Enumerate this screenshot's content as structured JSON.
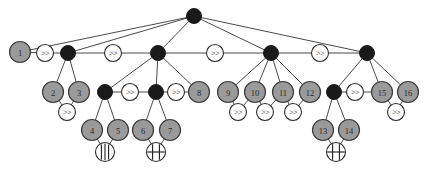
{
  "figure": {
    "background_color": "#ffffff",
    "width": 425,
    "height": 170
  },
  "legend": {
    "gray_node": "numbered leaf / task node",
    "black_node": "unlabeled junction node",
    "open_node": "operator marker node"
  },
  "glyphs": {
    "sequence": ">>",
    "parallel_bars": "|||",
    "sync_bar": "H"
  },
  "colors": {
    "gray_fill": "#9a9a9a",
    "black_fill": "#1a1a1a",
    "open_fill": "#ffffff",
    "edge": "#4a4a4a",
    "outline": "#3a3a3a"
  },
  "nodes": [
    {
      "id": "root",
      "kind": "black",
      "label": "",
      "x": 194,
      "y": 16,
      "r": 7.5
    },
    {
      "id": "n1",
      "kind": "gray",
      "label": "1",
      "x": 20,
      "y": 52,
      "r": 10.5
    },
    {
      "id": "op_a",
      "kind": "open",
      "glyph": ">>",
      "x": 45,
      "y": 53,
      "r": 8.5
    },
    {
      "id": "b1",
      "kind": "black",
      "label": "",
      "x": 68,
      "y": 53,
      "r": 7.5
    },
    {
      "id": "op_b",
      "kind": "open",
      "glyph": ">>",
      "x": 113,
      "y": 53,
      "r": 8.5
    },
    {
      "id": "b2",
      "kind": "black",
      "label": "",
      "x": 158,
      "y": 53,
      "r": 7.5
    },
    {
      "id": "op_c",
      "kind": "open",
      "glyph": ">>",
      "x": 215,
      "y": 53,
      "r": 8.5
    },
    {
      "id": "b3",
      "kind": "black",
      "label": "",
      "x": 271,
      "y": 53,
      "r": 7.5
    },
    {
      "id": "op_d",
      "kind": "open",
      "glyph": ">>",
      "x": 320,
      "y": 53,
      "r": 8.5
    },
    {
      "id": "b4",
      "kind": "black",
      "label": "",
      "x": 367,
      "y": 53,
      "r": 7.5
    },
    {
      "id": "n2",
      "kind": "gray",
      "label": "2",
      "x": 53,
      "y": 92,
      "r": 10.5
    },
    {
      "id": "n3",
      "kind": "gray",
      "label": "3",
      "x": 79,
      "y": 92,
      "r": 10.5
    },
    {
      "id": "op_e",
      "kind": "open",
      "glyph": ">>",
      "x": 67,
      "y": 112,
      "r": 8.5
    },
    {
      "id": "b5",
      "kind": "black",
      "label": "",
      "x": 105,
      "y": 92,
      "r": 7.5
    },
    {
      "id": "op_f",
      "kind": "open",
      "glyph": ">>",
      "x": 130,
      "y": 92,
      "r": 8.5
    },
    {
      "id": "b6",
      "kind": "black",
      "label": "",
      "x": 156,
      "y": 92,
      "r": 7.5
    },
    {
      "id": "op_g",
      "kind": "open",
      "glyph": ">>",
      "x": 176,
      "y": 92,
      "r": 8.5
    },
    {
      "id": "n8",
      "kind": "gray",
      "label": "8",
      "x": 199,
      "y": 92,
      "r": 10.5
    },
    {
      "id": "n4",
      "kind": "gray",
      "label": "4",
      "x": 92,
      "y": 130,
      "r": 10.5
    },
    {
      "id": "n5",
      "kind": "gray",
      "label": "5",
      "x": 118,
      "y": 130,
      "r": 10.5
    },
    {
      "id": "g_bars",
      "kind": "glyph",
      "glyph": "|||",
      "x": 105,
      "y": 152,
      "r": 9.5
    },
    {
      "id": "n6",
      "kind": "gray",
      "label": "6",
      "x": 143,
      "y": 130,
      "r": 10.5
    },
    {
      "id": "n7",
      "kind": "gray",
      "label": "7",
      "x": 170,
      "y": 130,
      "r": 10.5
    },
    {
      "id": "g_synca",
      "kind": "glyph",
      "glyph": "H",
      "x": 156,
      "y": 152,
      "r": 9.5
    },
    {
      "id": "n9",
      "kind": "gray",
      "label": "9",
      "x": 228,
      "y": 92,
      "r": 10.5
    },
    {
      "id": "op_h",
      "kind": "open",
      "glyph": ">>",
      "x": 238,
      "y": 112,
      "r": 8.5
    },
    {
      "id": "n10",
      "kind": "gray",
      "label": "10",
      "x": 255,
      "y": 92,
      "r": 10.5
    },
    {
      "id": "op_i",
      "kind": "open",
      "glyph": ">>",
      "x": 265,
      "y": 112,
      "r": 8.5
    },
    {
      "id": "n11",
      "kind": "gray",
      "label": "11",
      "x": 283,
      "y": 92,
      "r": 10.5
    },
    {
      "id": "op_j",
      "kind": "open",
      "glyph": ">>",
      "x": 293,
      "y": 112,
      "r": 8.5
    },
    {
      "id": "n12",
      "kind": "gray",
      "label": "12",
      "x": 310,
      "y": 92,
      "r": 10.5
    },
    {
      "id": "b7",
      "kind": "black",
      "label": "",
      "x": 334,
      "y": 92,
      "r": 7.5
    },
    {
      "id": "op_k",
      "kind": "open",
      "glyph": ">>",
      "x": 355,
      "y": 92,
      "r": 8.5
    },
    {
      "id": "n15",
      "kind": "gray",
      "label": "15",
      "x": 382,
      "y": 92,
      "r": 10.5
    },
    {
      "id": "n16",
      "kind": "gray",
      "label": "16",
      "x": 408,
      "y": 92,
      "r": 10.5
    },
    {
      "id": "op_l",
      "kind": "open",
      "glyph": ">>",
      "x": 396,
      "y": 112,
      "r": 8.5
    },
    {
      "id": "n13",
      "kind": "gray",
      "label": "13",
      "x": 323,
      "y": 130,
      "r": 10.5
    },
    {
      "id": "n14",
      "kind": "gray",
      "label": "14",
      "x": 349,
      "y": 130,
      "r": 10.5
    },
    {
      "id": "g_syncb",
      "kind": "glyph",
      "glyph": "H",
      "x": 336,
      "y": 152,
      "r": 9.5
    }
  ],
  "edges": [
    {
      "from": "root",
      "to": "n1"
    },
    {
      "from": "root",
      "to": "b1"
    },
    {
      "from": "root",
      "to": "b2"
    },
    {
      "from": "root",
      "to": "b3"
    },
    {
      "from": "root",
      "to": "b4"
    },
    {
      "from": "n1",
      "to": "op_a"
    },
    {
      "from": "op_a",
      "to": "b1"
    },
    {
      "from": "b1",
      "to": "op_b"
    },
    {
      "from": "op_b",
      "to": "b2"
    },
    {
      "from": "b2",
      "to": "op_c"
    },
    {
      "from": "op_c",
      "to": "b3"
    },
    {
      "from": "b3",
      "to": "op_d"
    },
    {
      "from": "op_d",
      "to": "b4"
    },
    {
      "from": "b1",
      "to": "n2"
    },
    {
      "from": "b1",
      "to": "n3"
    },
    {
      "from": "n2",
      "to": "op_e"
    },
    {
      "from": "n3",
      "to": "op_e"
    },
    {
      "from": "b2",
      "to": "b5"
    },
    {
      "from": "b2",
      "to": "b6"
    },
    {
      "from": "b2",
      "to": "n8"
    },
    {
      "from": "b5",
      "to": "op_f"
    },
    {
      "from": "op_f",
      "to": "b6"
    },
    {
      "from": "b6",
      "to": "op_g"
    },
    {
      "from": "op_g",
      "to": "n8"
    },
    {
      "from": "b5",
      "to": "n4"
    },
    {
      "from": "b5",
      "to": "n5"
    },
    {
      "from": "n4",
      "to": "g_bars"
    },
    {
      "from": "n5",
      "to": "g_bars"
    },
    {
      "from": "b6",
      "to": "n6"
    },
    {
      "from": "b6",
      "to": "n7"
    },
    {
      "from": "n6",
      "to": "g_synca"
    },
    {
      "from": "n7",
      "to": "g_synca"
    },
    {
      "from": "b3",
      "to": "n9"
    },
    {
      "from": "b3",
      "to": "n10"
    },
    {
      "from": "b3",
      "to": "n11"
    },
    {
      "from": "b3",
      "to": "n12"
    },
    {
      "from": "n9",
      "to": "op_h"
    },
    {
      "from": "n10",
      "to": "op_h"
    },
    {
      "from": "n10",
      "to": "op_i"
    },
    {
      "from": "n11",
      "to": "op_i"
    },
    {
      "from": "n11",
      "to": "op_j"
    },
    {
      "from": "n12",
      "to": "op_j"
    },
    {
      "from": "b4",
      "to": "b7"
    },
    {
      "from": "b4",
      "to": "n15"
    },
    {
      "from": "b4",
      "to": "n16"
    },
    {
      "from": "b7",
      "to": "op_k"
    },
    {
      "from": "op_k",
      "to": "n15"
    },
    {
      "from": "n15",
      "to": "op_l"
    },
    {
      "from": "n16",
      "to": "op_l"
    },
    {
      "from": "b7",
      "to": "n13"
    },
    {
      "from": "b7",
      "to": "n14"
    },
    {
      "from": "n13",
      "to": "g_syncb"
    },
    {
      "from": "n14",
      "to": "g_syncb"
    }
  ]
}
